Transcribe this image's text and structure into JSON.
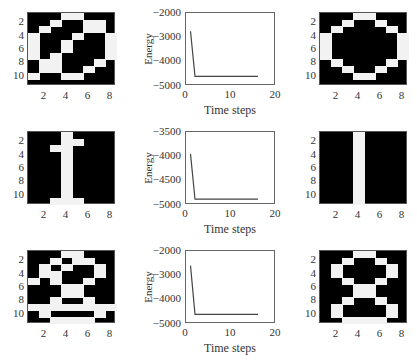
{
  "figure": {
    "rows": [
      {
        "input_pattern": {
          "label": "noisy-zero",
          "rows": 11,
          "cols": 8,
          "pixels": [
            [
              0,
              0,
              0,
              1,
              1,
              0,
              0,
              0
            ],
            [
              0,
              0,
              1,
              0,
              0,
              1,
              1,
              0
            ],
            [
              0,
              1,
              0,
              0,
              0,
              1,
              1,
              0
            ],
            [
              1,
              0,
              0,
              0,
              1,
              0,
              0,
              1
            ],
            [
              1,
              0,
              0,
              1,
              0,
              0,
              0,
              1
            ],
            [
              1,
              0,
              0,
              1,
              0,
              0,
              0,
              1
            ],
            [
              1,
              0,
              1,
              0,
              0,
              0,
              0,
              1
            ],
            [
              0,
              1,
              1,
              0,
              0,
              0,
              1,
              0
            ],
            [
              0,
              1,
              1,
              0,
              0,
              1,
              0,
              0
            ],
            [
              1,
              0,
              0,
              1,
              1,
              0,
              0,
              0
            ],
            [
              0,
              0,
              0,
              0,
              0,
              0,
              0,
              0
            ]
          ],
          "yticks": [
            "2",
            "4",
            "6",
            "8",
            "10"
          ],
          "xticks": [
            "2",
            "4",
            "6",
            "8"
          ]
        },
        "output_pattern": {
          "label": "recalled-zero",
          "rows": 11,
          "cols": 8,
          "pixels": [
            [
              0,
              0,
              0,
              1,
              1,
              0,
              0,
              0
            ],
            [
              0,
              0,
              1,
              0,
              0,
              1,
              0,
              0
            ],
            [
              0,
              1,
              0,
              0,
              0,
              0,
              1,
              0
            ],
            [
              1,
              0,
              0,
              0,
              0,
              0,
              0,
              1
            ],
            [
              1,
              0,
              0,
              0,
              0,
              0,
              0,
              1
            ],
            [
              1,
              0,
              0,
              0,
              0,
              0,
              0,
              1
            ],
            [
              1,
              0,
              0,
              0,
              0,
              0,
              0,
              1
            ],
            [
              0,
              1,
              0,
              0,
              0,
              0,
              1,
              0
            ],
            [
              0,
              0,
              1,
              0,
              0,
              1,
              0,
              0
            ],
            [
              0,
              0,
              0,
              1,
              1,
              0,
              0,
              0
            ],
            [
              0,
              0,
              0,
              0,
              0,
              0,
              0,
              0
            ]
          ],
          "yticks": [
            "2",
            "4",
            "6",
            "8",
            "10"
          ],
          "xticks": [
            "2",
            "4",
            "6",
            "8"
          ]
        }
      },
      {
        "input_pattern": {
          "label": "noisy-one",
          "rows": 11,
          "cols": 8,
          "pixels": [
            [
              0,
              0,
              0,
              1,
              0,
              0,
              0,
              0
            ],
            [
              0,
              0,
              0,
              1,
              1,
              0,
              0,
              0
            ],
            [
              0,
              0,
              1,
              1,
              0,
              0,
              0,
              0
            ],
            [
              0,
              0,
              0,
              1,
              0,
              0,
              0,
              0
            ],
            [
              0,
              0,
              0,
              1,
              0,
              0,
              0,
              0
            ],
            [
              0,
              0,
              0,
              1,
              0,
              0,
              0,
              0
            ],
            [
              0,
              0,
              0,
              1,
              0,
              0,
              0,
              0
            ],
            [
              0,
              0,
              0,
              1,
              0,
              0,
              0,
              0
            ],
            [
              0,
              0,
              0,
              1,
              0,
              0,
              0,
              0
            ],
            [
              0,
              0,
              0,
              1,
              0,
              0,
              0,
              0
            ],
            [
              0,
              0,
              1,
              1,
              1,
              0,
              0,
              0
            ]
          ],
          "yticks": [
            "2",
            "4",
            "6",
            "8",
            "10"
          ],
          "xticks": [
            "2",
            "4",
            "6",
            "8"
          ]
        },
        "output_pattern": {
          "label": "recalled-one",
          "rows": 11,
          "cols": 8,
          "pixels": [
            [
              0,
              0,
              0,
              1,
              0,
              0,
              0,
              0
            ],
            [
              0,
              0,
              0,
              1,
              0,
              0,
              0,
              0
            ],
            [
              0,
              0,
              0,
              1,
              0,
              0,
              0,
              0
            ],
            [
              0,
              0,
              0,
              1,
              0,
              0,
              0,
              0
            ],
            [
              0,
              0,
              0,
              1,
              0,
              0,
              0,
              0
            ],
            [
              0,
              0,
              0,
              1,
              0,
              0,
              0,
              0
            ],
            [
              0,
              0,
              0,
              1,
              0,
              0,
              0,
              0
            ],
            [
              0,
              0,
              0,
              1,
              0,
              0,
              0,
              0
            ],
            [
              0,
              0,
              0,
              1,
              0,
              0,
              0,
              0
            ],
            [
              0,
              0,
              0,
              1,
              0,
              0,
              0,
              0
            ],
            [
              0,
              0,
              0,
              1,
              0,
              0,
              0,
              0
            ]
          ],
          "yticks": [
            "2",
            "4",
            "6",
            "8",
            "10"
          ],
          "xticks": [
            "2",
            "4",
            "6",
            "8"
          ]
        }
      },
      {
        "input_pattern": {
          "label": "noisy-eight",
          "rows": 11,
          "cols": 8,
          "pixels": [
            [
              0,
              0,
              0,
              1,
              1,
              0,
              0,
              0
            ],
            [
              0,
              0,
              1,
              0,
              1,
              1,
              0,
              0
            ],
            [
              0,
              1,
              0,
              1,
              0,
              0,
              1,
              0
            ],
            [
              0,
              1,
              1,
              0,
              0,
              0,
              1,
              0
            ],
            [
              1,
              0,
              1,
              0,
              0,
              1,
              0,
              0
            ],
            [
              0,
              0,
              0,
              1,
              1,
              0,
              0,
              0
            ],
            [
              0,
              0,
              0,
              1,
              1,
              0,
              0,
              0
            ],
            [
              0,
              0,
              1,
              0,
              0,
              1,
              0,
              0
            ],
            [
              1,
              1,
              1,
              1,
              1,
              1,
              1,
              1
            ],
            [
              0,
              1,
              0,
              0,
              0,
              0,
              1,
              0
            ],
            [
              0,
              0,
              1,
              1,
              1,
              1,
              0,
              0
            ]
          ],
          "yticks": [
            "2",
            "4",
            "6",
            "8",
            "10"
          ],
          "xticks": [
            "2",
            "4",
            "6",
            "8"
          ]
        },
        "output_pattern": {
          "label": "recalled-eight",
          "rows": 11,
          "cols": 8,
          "pixels": [
            [
              0,
              0,
              0,
              1,
              1,
              0,
              0,
              0
            ],
            [
              0,
              0,
              1,
              0,
              0,
              1,
              0,
              0
            ],
            [
              0,
              1,
              0,
              0,
              0,
              0,
              1,
              0
            ],
            [
              0,
              1,
              0,
              0,
              0,
              0,
              1,
              0
            ],
            [
              0,
              0,
              1,
              0,
              0,
              1,
              0,
              0
            ],
            [
              0,
              0,
              0,
              1,
              1,
              0,
              0,
              0
            ],
            [
              0,
              0,
              0,
              1,
              1,
              0,
              0,
              0
            ],
            [
              0,
              0,
              1,
              0,
              0,
              1,
              0,
              0
            ],
            [
              0,
              1,
              0,
              0,
              0,
              0,
              1,
              0
            ],
            [
              0,
              1,
              0,
              0,
              0,
              0,
              1,
              0
            ],
            [
              0,
              0,
              1,
              1,
              1,
              1,
              0,
              0
            ]
          ],
          "yticks": [
            "2",
            "4",
            "6",
            "8",
            "10"
          ],
          "xticks": [
            "2",
            "4",
            "6",
            "8"
          ]
        }
      }
    ]
  },
  "chart_data": [
    {
      "type": "line",
      "title": "",
      "xlabel": "Time steps",
      "ylabel": "Energy",
      "xlim": [
        0,
        20
      ],
      "ylim": [
        -5000,
        -2000
      ],
      "xticks": [
        "0",
        "10",
        "20"
      ],
      "yticks": [
        "-2000",
        "-3000",
        "-4000",
        "-5000"
      ],
      "grid": false,
      "series": [
        {
          "name": "energy",
          "x": [
            1,
            2,
            3,
            4,
            5,
            6,
            7,
            8,
            9,
            10,
            11,
            12,
            13,
            14,
            15,
            16
          ],
          "y": [
            -2750,
            -4600,
            -4600,
            -4600,
            -4600,
            -4600,
            -4600,
            -4600,
            -4600,
            -4600,
            -4600,
            -4600,
            -4600,
            -4600,
            -4600,
            -4600
          ]
        }
      ]
    },
    {
      "type": "line",
      "title": "",
      "xlabel": "Time steps",
      "ylabel": "Energy",
      "xlim": [
        0,
        20
      ],
      "ylim": [
        -5000,
        -3500
      ],
      "xticks": [
        "0",
        "10",
        "20"
      ],
      "yticks": [
        "-3500",
        "-4000",
        "-4500",
        "-5000"
      ],
      "grid": false,
      "series": [
        {
          "name": "energy",
          "x": [
            1,
            2,
            3,
            4,
            5,
            6,
            7,
            8,
            9,
            10,
            11,
            12,
            13,
            14,
            15,
            16
          ],
          "y": [
            -3950,
            -4880,
            -4880,
            -4880,
            -4880,
            -4880,
            -4880,
            -4880,
            -4880,
            -4880,
            -4880,
            -4880,
            -4880,
            -4880,
            -4880,
            -4880
          ]
        }
      ]
    },
    {
      "type": "line",
      "title": "",
      "xlabel": "Time steps",
      "ylabel": "Energy",
      "xlim": [
        0,
        20
      ],
      "ylim": [
        -5000,
        -2000
      ],
      "xticks": [
        "0",
        "10",
        "20"
      ],
      "yticks": [
        "-2000",
        "-3000",
        "-4000",
        "-5000"
      ],
      "grid": false,
      "series": [
        {
          "name": "energy",
          "x": [
            1,
            2,
            3,
            4,
            5,
            6,
            7,
            8,
            9,
            10,
            11,
            12,
            13,
            14,
            15,
            16
          ],
          "y": [
            -2600,
            -4600,
            -4600,
            -4600,
            -4600,
            -4600,
            -4600,
            -4600,
            -4600,
            -4600,
            -4600,
            -4600,
            -4600,
            -4600,
            -4600,
            -4600
          ]
        }
      ]
    }
  ],
  "colors": {
    "pixel_on": "#f2f2f2",
    "pixel_off": "#000000",
    "line": "#444444",
    "axis": "#666666"
  }
}
